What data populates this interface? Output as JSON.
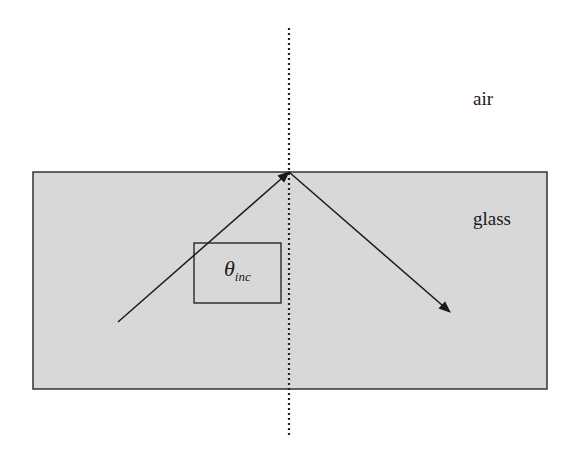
{
  "diagram": {
    "labels": {
      "upper_medium": "air",
      "lower_medium": "glass",
      "angle_symbol": "θ",
      "angle_subscript": "inc"
    },
    "colors": {
      "glass_fill": "#d8d8d8",
      "border": "#333333",
      "ray": "#1a1a1a",
      "normal": "#222222",
      "background": "#ffffff"
    },
    "geometry": {
      "glass_rect": {
        "x": 33,
        "y": 172,
        "width": 514,
        "height": 217
      },
      "normal_line": {
        "x": 289,
        "y1": 28,
        "y2": 438
      },
      "incident_ray": {
        "x1": 118,
        "y1": 322,
        "x2": 289,
        "y2": 172
      },
      "reflected_ray": {
        "x1": 289,
        "y1": 172,
        "x2": 450,
        "y2": 312
      },
      "angle_box": {
        "x": 194,
        "y": 243,
        "width": 87,
        "height": 60
      }
    }
  }
}
